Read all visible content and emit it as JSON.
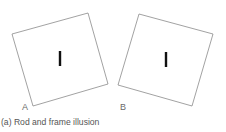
{
  "figure": {
    "caption": "(a) Rod and frame illusion",
    "panels": [
      {
        "label": "A",
        "frame": {
          "points": [
            [
              12,
              34
            ],
            [
              88,
              13
            ],
            [
              108,
              84
            ],
            [
              33,
              106
            ]
          ],
          "stroke": "#8a8a8a"
        },
        "rod": {
          "x": 60,
          "y1": 51,
          "y2": 66,
          "color": "#111111"
        }
      },
      {
        "label": "B",
        "frame": {
          "points": [
            [
              139,
              14
            ],
            [
              213,
              34
            ],
            [
              192,
              106
            ],
            [
              118,
              85
            ]
          ],
          "stroke": "#8a8a8a"
        },
        "rod": {
          "x": 166,
          "y1": 52,
          "y2": 67,
          "color": "#111111"
        }
      }
    ]
  }
}
